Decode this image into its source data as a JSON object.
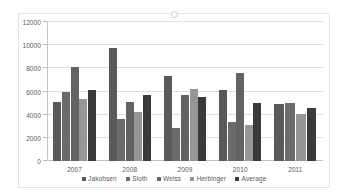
{
  "chart_data": {
    "type": "bar",
    "title": "",
    "xlabel": "",
    "ylabel": "",
    "categories": [
      "2007",
      "2008",
      "2009",
      "2010",
      "2011"
    ],
    "ylim": [
      0,
      12000
    ],
    "y_ticks": [
      0,
      2000,
      4000,
      6000,
      8000,
      10000,
      12000
    ],
    "y_tick_labels": [
      "0",
      "2000",
      "4000",
      "6000",
      "8000",
      "10000",
      "12000"
    ],
    "grid": true,
    "legend_position": "bottom",
    "series": [
      {
        "name": "Jakobsen",
        "color": "#595959",
        "values": [
          5100,
          9750,
          7300,
          6150,
          4900
        ]
      },
      {
        "name": "Sloth",
        "color": "#6b6b6b",
        "values": [
          6000,
          3650,
          2850,
          3400,
          5000
        ]
      },
      {
        "name": "Weiss",
        "color": "#636363",
        "values": [
          8150,
          5100,
          5700,
          7600,
          null
        ]
      },
      {
        "name": "Herbinger",
        "color": "#969696",
        "values": [
          5350,
          4250,
          6250,
          3100,
          4050
        ]
      },
      {
        "name": "Average",
        "color": "#3a3a3a",
        "values": [
          6150,
          5700,
          5550,
          5050,
          4600
        ]
      }
    ]
  }
}
